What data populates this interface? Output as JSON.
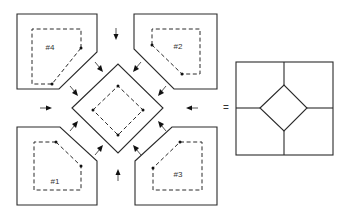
{
  "diagram": {
    "type": "tile-assembly",
    "pieces": [
      {
        "id": "piece-4",
        "label": "#4",
        "position": "top-left"
      },
      {
        "id": "piece-2",
        "label": "#2",
        "position": "top-right"
      },
      {
        "id": "piece-1",
        "label": "#1",
        "position": "bottom-left"
      },
      {
        "id": "piece-3",
        "label": "#3",
        "position": "bottom-right"
      }
    ],
    "center_piece": {
      "shape": "diamond",
      "label": ""
    },
    "equals_sign": "=",
    "result": {
      "shape": "square-with-inscribed-diamond"
    },
    "colors": {
      "stroke": "#2a2a2a",
      "background": "#ffffff"
    }
  }
}
